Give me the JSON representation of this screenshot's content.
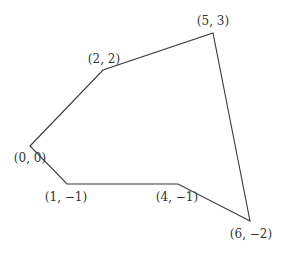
{
  "diagram": {
    "type": "polygon",
    "stroke_color": "#3a3a3a",
    "vertices": [
      {
        "label": "(0, 0)",
        "x": 0,
        "y": 0
      },
      {
        "label": "(2, 2)",
        "x": 2,
        "y": 2
      },
      {
        "label": "(5, 3)",
        "x": 5,
        "y": 3
      },
      {
        "label": "(6, −2)",
        "x": 6,
        "y": -2
      },
      {
        "label": "(4, −1)",
        "x": 4,
        "y": -1
      },
      {
        "label": "(1, −1)",
        "x": 1,
        "y": -1
      }
    ]
  }
}
